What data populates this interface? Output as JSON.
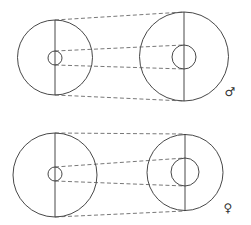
{
  "diagram": {
    "type": "pulley-comparison",
    "panels": [
      {
        "id": "male",
        "label": "♂",
        "label_pos": [
          230,
          96
        ],
        "left_wheel": {
          "cx": 55,
          "cy": 57.5,
          "r": 37.5,
          "hub_cx": 55,
          "hub_cy": 58,
          "hub_r": 7
        },
        "right_wheel": {
          "cx": 184,
          "cy": 56.5,
          "r": 44.5,
          "hub_cx": 184,
          "hub_cy": 57,
          "hub_r": 12
        },
        "axis_left": [
          55,
          20,
          55,
          95
        ],
        "axis_right": [
          184,
          12,
          184,
          101
        ],
        "dashed_lines": [
          [
            55,
            20,
            184,
            12
          ],
          [
            55,
            51,
            184,
            45
          ],
          [
            55,
            65,
            184,
            69
          ],
          [
            55,
            95,
            184,
            101
          ]
        ]
      },
      {
        "id": "female",
        "label": "♀",
        "label_pos": [
          228,
          212
        ],
        "left_wheel": {
          "cx": 55,
          "cy": 175,
          "r": 42,
          "hub_cx": 55,
          "hub_cy": 174,
          "hub_r": 7
        },
        "right_wheel": {
          "cx": 185,
          "cy": 172.5,
          "r": 38,
          "hub_cx": 185,
          "hub_cy": 172,
          "hub_r": 14
        },
        "axis_left": [
          55,
          133,
          55,
          217
        ],
        "axis_right": [
          185,
          134,
          185,
          211
        ],
        "dashed_lines": [
          [
            55,
            133,
            185,
            134
          ],
          [
            55,
            167,
            185,
            158
          ],
          [
            55,
            181,
            185,
            186
          ],
          [
            55,
            217,
            185,
            211
          ]
        ]
      }
    ]
  },
  "colors": {
    "stroke": "#333333",
    "dash": "#555555",
    "background": "#ffffff"
  }
}
